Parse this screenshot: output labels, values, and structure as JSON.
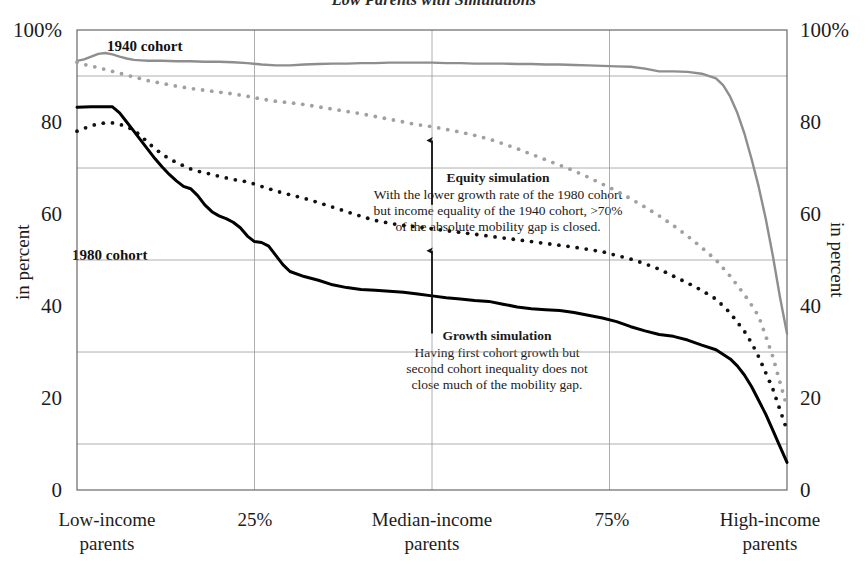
{
  "chart_data": {
    "type": "line",
    "title": "Low Parents with Simulations",
    "xlabel": "",
    "ylabel": "in percent",
    "ylabel_right": "in percent",
    "xlim": [
      0,
      100
    ],
    "ylim": [
      0,
      100
    ],
    "grid": true,
    "gridlines_y": [
      10,
      30,
      50,
      70,
      90
    ],
    "gridlines_x": [
      25,
      50,
      75
    ],
    "ytick_labels": [
      "100%",
      "80",
      "60",
      "40",
      "20",
      "0"
    ],
    "ytick_values": [
      100,
      80,
      60,
      40,
      20,
      0
    ],
    "ytick_labels_right": [
      "100%",
      "80",
      "60",
      "40",
      "20",
      "0"
    ],
    "xtick_labels": [
      "Low-income\nparents",
      "25%",
      "Median-income\nparents",
      "75%",
      "High-income\nparents"
    ],
    "xtick_values": [
      3,
      25,
      50,
      75,
      97
    ],
    "legend_position": "inline",
    "series": [
      {
        "name": "1940 cohort",
        "style": "solid-gray",
        "color": "#8e8e8e",
        "label_x": 25,
        "label_y": 95,
        "x": [
          0,
          1,
          2,
          3,
          4,
          5,
          6,
          7,
          8,
          9,
          10,
          12,
          14,
          16,
          18,
          20,
          22,
          24,
          26,
          28,
          30,
          32,
          34,
          36,
          38,
          40,
          42,
          44,
          46,
          48,
          50,
          52,
          54,
          56,
          58,
          60,
          62,
          64,
          66,
          68,
          70,
          72,
          74,
          76,
          78,
          80,
          82,
          84,
          86,
          88,
          90,
          91,
          92,
          93,
          94,
          95,
          96,
          97,
          98,
          99,
          100
        ],
        "values": [
          93.3,
          93.6,
          94.2,
          94.8,
          95.0,
          94.7,
          94.2,
          93.8,
          93.5,
          93.4,
          93.3,
          93.3,
          93.2,
          93.2,
          93.1,
          93.1,
          93.0,
          92.8,
          92.5,
          92.3,
          92.3,
          92.5,
          92.6,
          92.7,
          92.7,
          92.8,
          92.8,
          92.9,
          92.9,
          92.9,
          92.9,
          92.8,
          92.8,
          92.7,
          92.7,
          92.7,
          92.6,
          92.6,
          92.5,
          92.5,
          92.4,
          92.3,
          92.2,
          92.1,
          92.0,
          91.6,
          91.0,
          91.0,
          90.9,
          90.5,
          89.5,
          88.0,
          85.5,
          82.0,
          77.5,
          72.0,
          66.0,
          59.0,
          51.0,
          42.0,
          34.0
        ]
      },
      {
        "name": "Equity simulation",
        "style": "dotted-gray",
        "color": "#a0a0a0",
        "x": [
          0,
          1,
          2,
          3,
          4,
          5,
          6,
          7,
          8,
          9,
          10,
          12,
          14,
          16,
          18,
          20,
          22,
          24,
          26,
          28,
          30,
          32,
          34,
          36,
          38,
          40,
          42,
          44,
          46,
          48,
          50,
          52,
          54,
          56,
          58,
          60,
          62,
          64,
          66,
          68,
          70,
          72,
          74,
          76,
          78,
          80,
          82,
          84,
          86,
          88,
          90,
          92,
          94,
          95,
          96,
          97,
          98,
          99,
          100
        ],
        "values": [
          93.0,
          92.5,
          92.2,
          91.8,
          91.4,
          91.0,
          90.6,
          90.2,
          89.8,
          89.4,
          89.0,
          88.4,
          87.8,
          87.3,
          86.9,
          86.5,
          86.1,
          85.6,
          85.0,
          84.5,
          84.2,
          83.8,
          83.3,
          82.8,
          82.3,
          81.8,
          81.2,
          80.6,
          80.0,
          79.4,
          79.0,
          78.4,
          77.8,
          77.1,
          76.3,
          75.3,
          74.2,
          73.0,
          71.8,
          70.6,
          69.4,
          68.0,
          66.5,
          65.0,
          63.3,
          61.5,
          59.6,
          57.5,
          55.2,
          52.7,
          50.0,
          46.5,
          42.5,
          40.2,
          37.8,
          33.5,
          29.0,
          23.5,
          18.0
        ]
      },
      {
        "name": "Growth simulation",
        "style": "dotted-black",
        "color": "#111111",
        "x": [
          0,
          1,
          2,
          3,
          4,
          5,
          6,
          7,
          8,
          9,
          10,
          11,
          12,
          13,
          14,
          15,
          16,
          17,
          18,
          19,
          20,
          22,
          24,
          26,
          28,
          30,
          32,
          34,
          36,
          38,
          40,
          42,
          44,
          46,
          48,
          50,
          52,
          54,
          56,
          58,
          60,
          62,
          64,
          66,
          68,
          70,
          72,
          74,
          76,
          78,
          80,
          82,
          84,
          86,
          88,
          90,
          92,
          94,
          95,
          96,
          97,
          98,
          99,
          100
        ],
        "values": [
          78.0,
          78.6,
          79.2,
          79.6,
          79.8,
          79.8,
          79.5,
          79.0,
          78.2,
          77.0,
          75.5,
          74.2,
          73.0,
          72.0,
          71.2,
          70.5,
          69.8,
          69.3,
          69.0,
          68.6,
          68.2,
          67.5,
          67.0,
          66.0,
          65.0,
          64.2,
          63.4,
          62.5,
          61.5,
          60.5,
          59.5,
          58.6,
          58.0,
          57.5,
          57.2,
          56.8,
          56.4,
          56.0,
          55.6,
          55.2,
          54.8,
          54.4,
          54.0,
          53.6,
          53.2,
          52.8,
          52.3,
          51.8,
          51.0,
          50.2,
          49.2,
          48.0,
          46.5,
          45.0,
          43.4,
          41.5,
          38.5,
          34.5,
          32.0,
          29.0,
          25.5,
          22.0,
          17.5,
          13.0
        ]
      },
      {
        "name": "1980 cohort",
        "style": "solid-black",
        "color": "#000000",
        "label_x": 14,
        "label_y": 51,
        "x": [
          0,
          2,
          4,
          5,
          6,
          7,
          8,
          9,
          10,
          11,
          12,
          13,
          14,
          15,
          16,
          17,
          18,
          19,
          20,
          21,
          22,
          23,
          24,
          25,
          26,
          27,
          28,
          29,
          30,
          32,
          34,
          36,
          38,
          40,
          42,
          44,
          46,
          48,
          50,
          52,
          54,
          56,
          58,
          60,
          62,
          64,
          66,
          68,
          70,
          72,
          74,
          76,
          78,
          80,
          82,
          84,
          86,
          88,
          90,
          92,
          93,
          94,
          95,
          96,
          97,
          98,
          99,
          100
        ],
        "values": [
          83.2,
          83.3,
          83.3,
          83.3,
          82.0,
          80.0,
          78.0,
          76.0,
          74.0,
          72.0,
          70.2,
          68.6,
          67.2,
          66.0,
          65.5,
          64.0,
          62.0,
          60.5,
          59.6,
          59.0,
          58.2,
          57.0,
          55.2,
          54.0,
          53.8,
          53.0,
          51.0,
          49.0,
          47.5,
          46.4,
          45.6,
          44.6,
          44.0,
          43.6,
          43.4,
          43.2,
          43.0,
          42.6,
          42.2,
          41.8,
          41.5,
          41.2,
          41.0,
          40.4,
          39.8,
          39.4,
          39.2,
          39.0,
          38.6,
          38.0,
          37.4,
          36.6,
          35.5,
          34.6,
          33.8,
          33.4,
          32.6,
          31.5,
          30.5,
          28.5,
          27.0,
          25.0,
          22.5,
          19.5,
          16.5,
          13.0,
          9.5,
          6.0
        ]
      }
    ],
    "annotations": [
      {
        "id": "equity-simulation",
        "title": "Equity simulation",
        "body": "With the lower growth rate of the 1980 cohort\nbut income equality of the 1940 cohort, >70%\nof the absolute mobility gap is closed.",
        "arrow_x": 50,
        "arrow_from_y": 62,
        "arrow_to_y": 76
      },
      {
        "id": "growth-simulation",
        "title": "Growth simulation",
        "body": "Having first cohort growth but\nsecond cohort inequality does not\nclose much of the mobility gap.",
        "arrow_x": 50,
        "arrow_from_y": 34,
        "arrow_to_y": 52
      }
    ]
  }
}
